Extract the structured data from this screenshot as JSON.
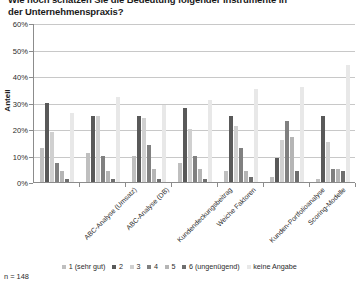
{
  "title": "Wie hoch schätzen Sie die Bedeutung folgender Instrumente in\nder Unternehmenspraxis?",
  "footnote": "n = 148",
  "axis": {
    "ylabel": "Anteil",
    "yticks": [
      "0%",
      "10%",
      "20%",
      "30%",
      "40%",
      "50%",
      "60%"
    ]
  },
  "colors": {
    "s1": "#bfbfbf",
    "s2": "#595959",
    "s3": "#d0d0d0",
    "s4": "#808080",
    "s5": "#b5b5b5",
    "s6": "#6e6e6e",
    "s7": "#e8e8e8",
    "grid": "#c8c8c8",
    "axis": "#8c8c8c"
  },
  "legend": {
    "items": [
      {
        "label": "1 (sehr gut)",
        "color": "#bfbfbf"
      },
      {
        "label": "2",
        "color": "#595959"
      },
      {
        "label": "3",
        "color": "#d0d0d0"
      },
      {
        "label": "4",
        "color": "#808080"
      },
      {
        "label": "5",
        "color": "#b5b5b5"
      },
      {
        "label": "6 (ungenügend)",
        "color": "#6e6e6e"
      },
      {
        "label": "keine Angabe",
        "color": "#e8e8e8"
      }
    ]
  },
  "chart_data": {
    "type": "bar",
    "title": "Wie hoch schätzen Sie die Bedeutung folgender Instrumente in der Unternehmenspraxis?",
    "xlabel": "",
    "ylabel": "Anteil",
    "ylim": [
      0,
      60
    ],
    "ytick_step": 10,
    "ytick_suffix": "%",
    "grid": true,
    "legend_position": "bottom",
    "note": "n = 148",
    "categories": [
      "ABC-Analyse (Umsatz)",
      "ABC-Analyse (DB)",
      "Kundendeckungsbeitrag",
      "Weiche Faktoren",
      "Kunden-Portfolioanalyse",
      "Scoring-Modelle",
      "Customer Lifetime Value"
    ],
    "series": [
      {
        "name": "1 (sehr gut)",
        "color": "#bfbfbf",
        "values": [
          13,
          11,
          10,
          7,
          4,
          2,
          1
        ]
      },
      {
        "name": "2",
        "color": "#595959",
        "values": [
          30,
          25,
          25,
          28,
          25,
          9,
          25
        ]
      },
      {
        "name": "3",
        "color": "#d0d0d0",
        "values": [
          19,
          25,
          24,
          20,
          21,
          16,
          15
        ]
      },
      {
        "name": "4",
        "color": "#808080",
        "values": [
          7,
          10,
          14,
          10,
          13,
          23,
          5
        ]
      },
      {
        "name": "5",
        "color": "#b5b5b5",
        "values": [
          4,
          4,
          5,
          5,
          4,
          17,
          5
        ]
      },
      {
        "name": "6 (ungenügend)",
        "color": "#6e6e6e",
        "values": [
          1,
          1,
          1,
          1,
          2,
          4,
          4
        ]
      },
      {
        "name": "keine Angabe",
        "color": "#e8e8e8",
        "values": [
          26,
          32,
          29,
          31,
          35,
          36,
          44
        ]
      }
    ]
  }
}
